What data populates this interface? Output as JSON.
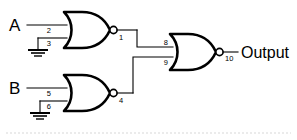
{
  "diagram": {
    "background_color": "#ffffff",
    "line_color": "#000000",
    "inputs": [
      {
        "label": "A",
        "name": "input-a"
      },
      {
        "label": "B",
        "name": "input-b"
      }
    ],
    "output": {
      "label": "Output",
      "name": "output-label"
    },
    "gates": [
      {
        "name": "nor-gate-1",
        "type": "NOR",
        "input_pins": [
          "2",
          "3"
        ],
        "output_pin": "1",
        "input_sources": [
          "A",
          "GND"
        ]
      },
      {
        "name": "nor-gate-2",
        "type": "NOR",
        "input_pins": [
          "5",
          "6"
        ],
        "output_pin": "4",
        "input_sources": [
          "B",
          "GND"
        ]
      },
      {
        "name": "nor-gate-3",
        "type": "NOR",
        "input_pins": [
          "8",
          "9"
        ],
        "output_pin": "10",
        "input_sources": [
          "1",
          "4"
        ]
      }
    ],
    "pin_numbers": {
      "g1_in_top": "2",
      "g1_in_bottom": "3",
      "g1_out": "1",
      "g2_in_top": "5",
      "g2_in_bottom": "6",
      "g2_out": "4",
      "g3_in_top": "8",
      "g3_in_bottom": "9",
      "g3_out": "10"
    },
    "grounds": [
      {
        "name": "ground-symbol-top"
      },
      {
        "name": "ground-symbol-bottom"
      }
    ]
  }
}
